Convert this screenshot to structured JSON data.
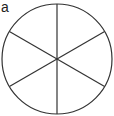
{
  "figure": {
    "label": "a",
    "shape": "circle",
    "divisions": 6,
    "center": [
      57,
      59
    ],
    "radius": 55,
    "line_color": "#333333",
    "line_angles_deg": [
      90,
      30,
      -30
    ]
  }
}
